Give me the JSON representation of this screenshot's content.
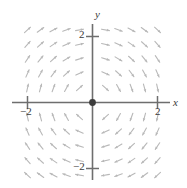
{
  "figure": {
    "name": "direction-field-plot",
    "background_color": "#ffffff"
  },
  "axes": {
    "x_label": "x",
    "y_label": "y",
    "axis_color": "#6e6e6e",
    "tick_labels": {
      "x_neg": "−2",
      "x_pos": "2",
      "y_neg": "−2",
      "y_pos": "2"
    }
  },
  "origin_point": {
    "label": "equilibrium-point",
    "color": "#3c3c3c"
  },
  "chart_data": {
    "type": "scatter",
    "title": "",
    "xlabel": "x",
    "ylabel": "y",
    "xlim": [
      -2.45,
      2.45
    ],
    "ylim": [
      -2.5,
      2.5
    ],
    "xticks": [
      -2,
      2
    ],
    "yticks": [
      -2,
      2
    ],
    "xtick_labels": [
      "−2",
      "2"
    ],
    "ytick_labels": [
      "−2",
      "2"
    ],
    "grid": false,
    "legend": null,
    "field": {
      "description": "clockwise spiral direction field",
      "arrow_color": "#b8b8b8",
      "arrow_length": 8,
      "grid_x": [
        -2.0,
        -1.6,
        -1.2,
        -0.8,
        -0.4,
        0.4,
        0.8,
        1.2,
        1.6,
        2.0
      ],
      "grid_y": [
        2.2,
        1.76,
        1.32,
        0.88,
        0.44,
        -0.44,
        -0.88,
        -1.32,
        -1.76,
        -2.2
      ],
      "u_formula": "y",
      "v_formula": "-x",
      "annotations": [
        {
          "x": 0,
          "y": 0,
          "marker": "filled-dot",
          "note": "equilibrium"
        }
      ]
    }
  }
}
